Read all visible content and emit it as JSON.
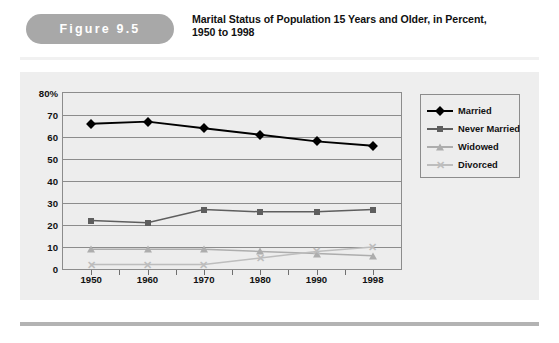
{
  "figure": {
    "badge_label": "Figure 9.5",
    "title_line1": "Marital Status of Population 15 Years and Older, in Percent,",
    "title_line2": "1950 to 1998",
    "badge_color": "#a8a8a8",
    "panel_color": "#eeeeee"
  },
  "chart_data": {
    "type": "line",
    "title": "Marital Status of Population 15 Years and Older, in Percent, 1950 to 1998",
    "xlabel": "",
    "ylabel": "",
    "categories": [
      "1950",
      "1960",
      "1970",
      "1980",
      "1990",
      "1998"
    ],
    "ylim": [
      0,
      80
    ],
    "yticks": [
      "0",
      "10",
      "20",
      "30",
      "40",
      "50",
      "60",
      "70",
      "80%"
    ],
    "ytick_values": [
      0,
      10,
      20,
      30,
      40,
      50,
      60,
      70,
      80
    ],
    "grid": true,
    "legend_position": "right",
    "series": [
      {
        "name": "Married",
        "color": "#000000",
        "marker": "diamond",
        "values": [
          66,
          67,
          64,
          61,
          58,
          56
        ]
      },
      {
        "name": "Never Married",
        "color": "#5e5e5e",
        "marker": "square",
        "values": [
          22,
          21,
          27,
          26,
          26,
          27
        ]
      },
      {
        "name": "Widowed",
        "color": "#adadad",
        "marker": "triangle",
        "values": [
          9,
          9,
          9,
          8,
          7,
          6
        ]
      },
      {
        "name": "Divorced",
        "color": "#bdbdbd",
        "marker": "x",
        "values": [
          2,
          2,
          2,
          5,
          8,
          10
        ]
      }
    ]
  }
}
